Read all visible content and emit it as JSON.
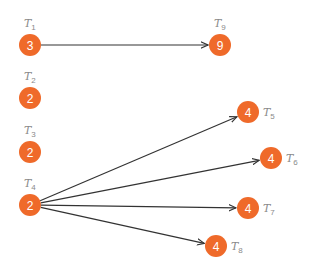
{
  "diagram": {
    "type": "task-dependency-graph",
    "node_color": "#ef6a2a",
    "edge_color": "#333333",
    "nodes": [
      {
        "id": "T1",
        "label_main": "T",
        "label_sub": "1",
        "value": "3",
        "x": 30,
        "y": 45,
        "label_pos": "above"
      },
      {
        "id": "T2",
        "label_main": "T",
        "label_sub": "2",
        "value": "2",
        "x": 30,
        "y": 98,
        "label_pos": "above"
      },
      {
        "id": "T3",
        "label_main": "T",
        "label_sub": "3",
        "value": "2",
        "x": 30,
        "y": 152,
        "label_pos": "above"
      },
      {
        "id": "T4",
        "label_main": "T",
        "label_sub": "4",
        "value": "2",
        "x": 30,
        "y": 205,
        "label_pos": "above"
      },
      {
        "id": "T5",
        "label_main": "T",
        "label_sub": "5",
        "value": "4",
        "x": 248,
        "y": 112,
        "label_pos": "right"
      },
      {
        "id": "T6",
        "label_main": "T",
        "label_sub": "6",
        "value": "4",
        "x": 271,
        "y": 158,
        "label_pos": "right"
      },
      {
        "id": "T7",
        "label_main": "T",
        "label_sub": "7",
        "value": "4",
        "x": 248,
        "y": 208,
        "label_pos": "right"
      },
      {
        "id": "T8",
        "label_main": "T",
        "label_sub": "8",
        "value": "4",
        "x": 216,
        "y": 246,
        "label_pos": "right"
      },
      {
        "id": "T9",
        "label_main": "T",
        "label_sub": "9",
        "value": "9",
        "x": 220,
        "y": 45,
        "label_pos": "above"
      }
    ],
    "edges": [
      {
        "from": "T1",
        "to": "T9"
      },
      {
        "from": "T4",
        "to": "T5"
      },
      {
        "from": "T4",
        "to": "T6"
      },
      {
        "from": "T4",
        "to": "T7"
      },
      {
        "from": "T4",
        "to": "T8"
      }
    ]
  }
}
